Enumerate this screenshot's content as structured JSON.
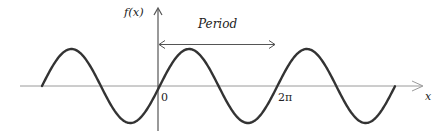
{
  "diagram": {
    "y_axis_label": "f(x)",
    "x_axis_label": "x",
    "annotation_label": "Period",
    "tick_labels": {
      "origin": "0",
      "two_pi": "2π"
    },
    "colors": {
      "curve": "#333333",
      "axis": "#8a8a8a",
      "y_axis": "#555555",
      "arrow": "#555555",
      "text": "#222222"
    },
    "wave": {
      "periods_shown": 3,
      "period_label": "2π"
    }
  }
}
